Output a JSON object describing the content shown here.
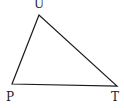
{
  "diagram": {
    "type": "triangle",
    "stroke_color": "#1a1a1a",
    "stroke_width": 1.2,
    "vertices": [
      {
        "id": "top",
        "label": "U",
        "x": 39,
        "y": 15
      },
      {
        "id": "left",
        "label": "P",
        "x": 12,
        "y": 84
      },
      {
        "id": "right",
        "label": "T",
        "x": 117,
        "y": 86
      }
    ]
  },
  "labels": {
    "top": "U",
    "left": "P",
    "right": "T"
  }
}
